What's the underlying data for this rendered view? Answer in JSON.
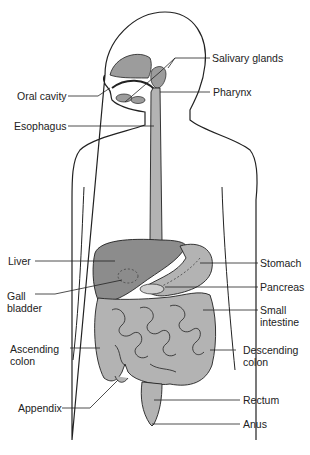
{
  "diagram": {
    "colors": {
      "organ_fill": "#b3b3b3",
      "dark_organ_fill": "#8c8c8c",
      "outline": "#222222",
      "body_fill": "#ffffff"
    },
    "labels": {
      "salivary_glands": "Salivary glands",
      "oral_cavity": "Oral cavity",
      "pharynx": "Pharynx",
      "esophagus": "Esophagus",
      "liver": "Liver",
      "stomach": "Stomach",
      "pancreas": "Pancreas",
      "gall_bladder_1": "Gall",
      "gall_bladder_2": "bladder",
      "small_intestine_1": "Small",
      "small_intestine_2": "intestine",
      "ascending_colon_1": "Ascending",
      "ascending_colon_2": "colon",
      "descending_colon_1": "Descending",
      "descending_colon_2": "colon",
      "appendix": "Appendix",
      "rectum": "Rectum",
      "anus": "Anus"
    }
  }
}
